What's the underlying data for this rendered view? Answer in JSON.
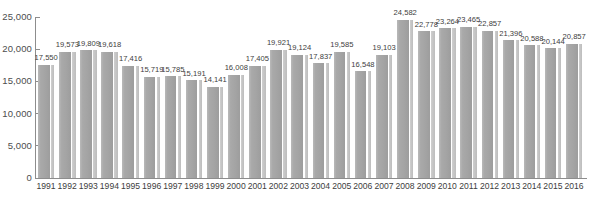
{
  "chart_data": {
    "type": "bar",
    "title": "",
    "subtitle": "",
    "xlabel": "",
    "ylabel": "",
    "grid": false,
    "legend": false,
    "legend_position": "none",
    "ylim": [
      0,
      25000
    ],
    "yticks": [
      0,
      5000,
      10000,
      15000,
      20000,
      25000
    ],
    "ytick_labels": [
      "0",
      "5,000",
      "10,000",
      "15,000",
      "20,000",
      "25,000"
    ],
    "categories": [
      "1991",
      "1992",
      "1993",
      "1994",
      "1995",
      "1996",
      "1997",
      "1998",
      "1999",
      "2000",
      "2001",
      "2002",
      "2003",
      "2004",
      "2005",
      "2006",
      "2007",
      "2008",
      "2009",
      "2010",
      "2011",
      "2012",
      "2013",
      "2014",
      "2015",
      "2016"
    ],
    "values": [
      17550,
      19573,
      19809,
      19618,
      17416,
      15719,
      15785,
      15191,
      14141,
      16008,
      17405,
      19921,
      19124,
      17837,
      19585,
      16548,
      19103,
      24582,
      22778,
      23264,
      23465,
      22857,
      21396,
      20588,
      20144,
      20857
    ],
    "value_labels": [
      "17,550",
      "19,573",
      "19,809",
      "19,618",
      "17,416",
      "15,719",
      "15,785",
      "15,191",
      "14,141",
      "16,008",
      "17,405",
      "19,921",
      "19,124",
      "17,837",
      "19,585",
      "16,548",
      "19,103",
      "24,582",
      "22,778",
      "23,264",
      "23,465",
      "22,857",
      "21,396",
      "20,588",
      "20,144",
      "20,857"
    ],
    "bar_color": "#a6a6a6",
    "bar_highlight_color": "#c6c6c6",
    "axis_color": "#8d8d8d",
    "text_color": "#3d3d3d",
    "background_color": "#ffffff"
  }
}
